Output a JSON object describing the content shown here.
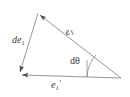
{
  "figure": {
    "name": "vector-triangle-rotation-diagram",
    "background_color": "#ffffff",
    "stroke_color": "#808080",
    "text_color": "#3a3a3a",
    "width": 130,
    "height": 97
  },
  "labels": {
    "de1": {
      "prefix": "d",
      "base": "e",
      "subscript": "1",
      "prime": "",
      "full": "de1"
    },
    "e1": {
      "prefix": "",
      "base": "e",
      "subscript": "1",
      "prime": "",
      "full": "e1"
    },
    "dtheta": {
      "prefix": "d",
      "base": "θ",
      "subscript": "",
      "prime": "",
      "full": "dθ"
    },
    "e1prime": {
      "prefix": "",
      "base": "e",
      "subscript": "1",
      "prime": "′",
      "full": "e1′"
    }
  },
  "geometry": {
    "vertices": {
      "top": {
        "x": 38,
        "y": 13
      },
      "bottom_left": {
        "x": 19,
        "y": 74
      },
      "bottom_right": {
        "x": 121,
        "y": 78
      }
    },
    "edges": [
      {
        "name": "e1-hypotenuse",
        "from": "bottom_right",
        "to": "top",
        "arrow_at": "top"
      },
      {
        "name": "de1-left-side",
        "from": "top",
        "to": "bottom_left",
        "arrow_at": "bottom_left"
      },
      {
        "name": "e1prime-base",
        "from": "bottom_right",
        "to": "bottom_left",
        "arrow_at": "bottom_left"
      }
    ],
    "angle_arc": {
      "name": "dtheta-arc",
      "vertex": "bottom_right",
      "radius": 34
    },
    "reference_tick": {
      "name": "vertical-tick",
      "x": 87,
      "y_top": 60,
      "y_bottom": 78
    }
  }
}
